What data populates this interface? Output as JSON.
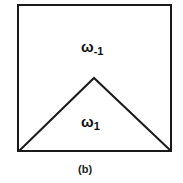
{
  "figure": {
    "caption": "(b)",
    "colors": {
      "stroke": "#1a1a1a",
      "background": "#ffffff",
      "text": "#111111"
    },
    "square": {
      "x1": 18,
      "y1": 5,
      "x2": 171,
      "y2": 151
    },
    "triangle": {
      "left": [
        19,
        151
      ],
      "apex": [
        94,
        78
      ],
      "right": [
        171,
        151
      ]
    },
    "regions": [
      {
        "id": "outer",
        "symbol": "ω",
        "subscript": "-1",
        "description": "region above the triangle inside the square"
      },
      {
        "id": "inner",
        "symbol": "ω",
        "subscript": "1",
        "description": "region inside the triangle"
      }
    ]
  }
}
